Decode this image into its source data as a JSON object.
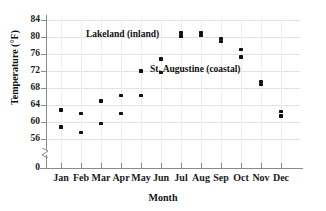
{
  "chart_data": {
    "type": "scatter",
    "title": "",
    "xlabel": "Month",
    "ylabel": "Temperature (°F)",
    "categories": [
      "Jan",
      "Feb",
      "Mar",
      "Apr",
      "May",
      "Jun",
      "Jul",
      "Aug",
      "Sep",
      "Oct",
      "Nov",
      "Dec"
    ],
    "ylim": [
      56,
      84
    ],
    "yticks": [
      0,
      56,
      60,
      64,
      68,
      72,
      76,
      80,
      84
    ],
    "ytick_labels": [
      "0",
      "56",
      "60",
      "64",
      "68",
      "72",
      "76",
      "80",
      "84"
    ],
    "y_axis_break": true,
    "grid": true,
    "legend_position": "inline-annotations",
    "series": [
      {
        "name": "Lakeland (inland)",
        "values": [
          62.8,
          62.0,
          64.9,
          66.3,
          72.0,
          74.8,
          81.0,
          81.0,
          79.7,
          77.0,
          69.5,
          62.5
        ]
      },
      {
        "name": "St. Augustine (coastal)",
        "values": [
          58.8,
          57.6,
          59.7,
          62.0,
          66.2,
          71.6,
          80.2,
          80.4,
          79.0,
          75.3,
          68.8,
          61.4
        ]
      }
    ],
    "annotations": [
      {
        "text": "Lakeland (inland)",
        "series": "Lakeland (inland)"
      },
      {
        "text": "St. Augustine (coastal)",
        "series": "St. Augustine (coastal)"
      }
    ]
  },
  "axes": {
    "y_title": "Temperature (°F)",
    "x_title": "Month",
    "y_ticks": [
      "84",
      "80",
      "76",
      "72",
      "68",
      "64",
      "60",
      "56",
      "0"
    ],
    "x_ticks": [
      "Jan",
      "Feb",
      "Mar",
      "Apr",
      "May",
      "Jun",
      "Jul",
      "Aug",
      "Sep",
      "Oct",
      "Nov",
      "Dec"
    ]
  },
  "colors": {
    "marker": "#111111",
    "grid": "#e2e2e6",
    "axis": "#8a8a8a",
    "background": "#ffffff"
  }
}
